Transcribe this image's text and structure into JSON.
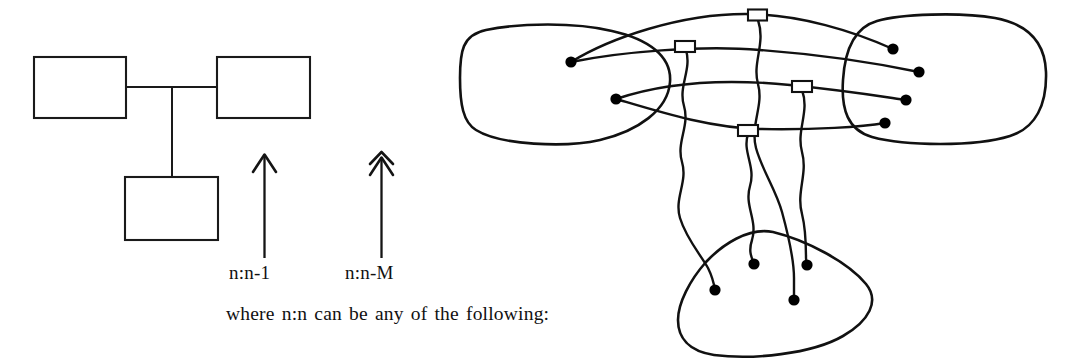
{
  "figure": {
    "caption": "where n:n can be any of the following:",
    "cardinality_labels": [
      {
        "id": "one-to-n-minus-1",
        "text": "n:n-1",
        "arrow": "single-chevron-up-arrow"
      },
      {
        "id": "one-to-n-minus-M",
        "text": "n:n-M",
        "arrow": "double-chevron-up-arrow"
      }
    ],
    "box_diagram": {
      "name": "three-box-relationship-diagram",
      "boxes": [
        {
          "id": "box-top-left",
          "label": "",
          "x": 34,
          "y": 57,
          "w": 92,
          "h": 61
        },
        {
          "id": "box-top-right",
          "label": "",
          "x": 217,
          "y": 57,
          "w": 93,
          "h": 61
        },
        {
          "id": "box-bottom",
          "label": "",
          "x": 125,
          "y": 177,
          "w": 93,
          "h": 63
        }
      ],
      "connector": {
        "id": "tee-connector",
        "horizontal_y": 87,
        "vertical_x": 172,
        "from_x": 126,
        "to_x": 217,
        "vertical_to_y": 177
      }
    },
    "set_diagram": {
      "name": "three-set-mapping-diagram",
      "sets": [
        {
          "id": "set-left",
          "dot_count": 2
        },
        {
          "id": "set-right",
          "dot_count": 4
        },
        {
          "id": "set-bottom",
          "dot_count": 4
        }
      ],
      "link_boxes": [
        {
          "id": "link-box-1",
          "x": 748,
          "y": 10,
          "w": 19,
          "h": 11
        },
        {
          "id": "link-box-2",
          "x": 675,
          "y": 41,
          "w": 20,
          "h": 11
        },
        {
          "id": "link-box-3",
          "x": 792,
          "y": 81,
          "w": 20,
          "h": 11
        },
        {
          "id": "link-box-4",
          "x": 738,
          "y": 125,
          "w": 20,
          "h": 11
        }
      ],
      "nodes_left": [
        {
          "id": "node-L1",
          "cx": 571,
          "cy": 62,
          "r": 5.6
        },
        {
          "id": "node-L2",
          "cx": 616,
          "cy": 99,
          "r": 5.6
        }
      ],
      "nodes_right": [
        {
          "id": "node-R1",
          "cx": 893,
          "cy": 49,
          "r": 5.6
        },
        {
          "id": "node-R2",
          "cx": 919,
          "cy": 72,
          "r": 5.6
        },
        {
          "id": "node-R3",
          "cx": 906,
          "cy": 100,
          "r": 5.6
        },
        {
          "id": "node-R4",
          "cx": 885,
          "cy": 123,
          "r": 5.6
        }
      ],
      "nodes_bottom": [
        {
          "id": "node-B1",
          "cx": 715,
          "cy": 290,
          "r": 5.6
        },
        {
          "id": "node-B2",
          "cx": 754,
          "cy": 264,
          "r": 5.6
        },
        {
          "id": "node-B3",
          "cx": 794,
          "cy": 300,
          "r": 5.6
        },
        {
          "id": "node-B4",
          "cx": 807,
          "cy": 265,
          "r": 5.6
        }
      ],
      "edge_count": 8,
      "wavy_edge_count": 4
    },
    "colors": {
      "ink": "#111111",
      "paper": "#ffffff"
    }
  }
}
